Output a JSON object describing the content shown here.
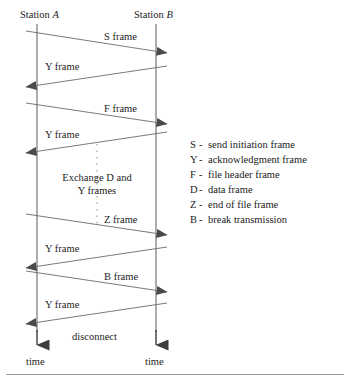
{
  "diagram": {
    "title_left": "Station A",
    "title_right": "Station B",
    "lifeline_left_label": "Station",
    "lifeline_left_italic": "A",
    "lifeline_right_label": "Station",
    "lifeline_right_italic": "B",
    "axis_label_left": "time",
    "axis_label_right": "time",
    "exchange_note_line1": "Exchange D and",
    "exchange_note_line2": "Y frames",
    "disconnect_label": "disconnect",
    "messages": [
      {
        "label": "S frame",
        "direction": "right"
      },
      {
        "label": "Y frame",
        "direction": "left"
      },
      {
        "label": "F frame",
        "direction": "right"
      },
      {
        "label": "Y frame",
        "direction": "left"
      },
      {
        "label": "Z frame",
        "direction": "right"
      },
      {
        "label": "Y frame",
        "direction": "left"
      },
      {
        "label": "B frame",
        "direction": "right"
      },
      {
        "label": "Y frame",
        "direction": "left"
      }
    ]
  },
  "legend": {
    "dash": "-",
    "items": [
      {
        "key": "S",
        "description": "send initiation frame"
      },
      {
        "key": "Y",
        "description": "acknowledgment frame"
      },
      {
        "key": "F",
        "description": "file header frame"
      },
      {
        "key": "D",
        "description": "data frame"
      },
      {
        "key": "Z",
        "description": "end of file frame"
      },
      {
        "key": "B",
        "description": "break transmission"
      }
    ]
  },
  "colors": {
    "line": "#555555",
    "text": "#1d1d1d",
    "rule": "#9a9a9a"
  }
}
